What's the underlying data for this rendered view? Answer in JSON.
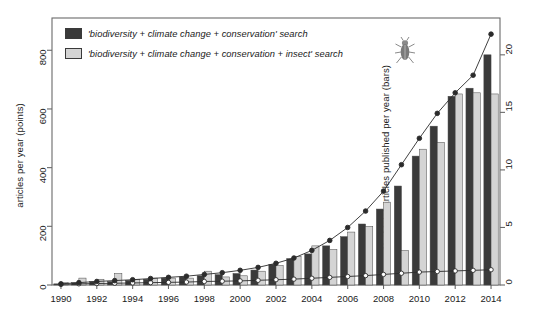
{
  "axes": {
    "left_title": "articles per year (points)",
    "right_title": "% of total articles published per year (bars)",
    "left_ticks": [
      "0",
      "200",
      "400",
      "600",
      "800"
    ],
    "right_ticks": [
      "0",
      "5",
      "10",
      "15",
      "20"
    ],
    "x_ticks": [
      "1990",
      "1992",
      "1994",
      "1996",
      "1998",
      "2000",
      "2002",
      "2004",
      "2006",
      "2008",
      "2010",
      "2012",
      "2014"
    ]
  },
  "legend": {
    "items": [
      {
        "label": "'biodiversity + climate change + conservation' search",
        "color": "#3a3a3a"
      },
      {
        "label": "'biodiversity + climate change + conservation + insect' search",
        "color": "#d4d4d4"
      }
    ],
    "decoration_icon": "beetle-icon"
  },
  "colors": {
    "dark_bar": "#3a3a3a",
    "light_bar": "#d4d4d4",
    "bar_stroke": "#4a4a4a",
    "line": "#2b2b2b",
    "frame": "#6a6a6a"
  },
  "chart_data": {
    "type": "bar",
    "title": "",
    "xlabel": "",
    "ylabel": "% of total articles published per year (bars)",
    "ylabel_secondary": "articles per year (points)",
    "grid": false,
    "legend_position": "top-left",
    "x": [
      1990,
      1991,
      1992,
      1993,
      1994,
      1995,
      1996,
      1997,
      1998,
      1999,
      2000,
      2001,
      2002,
      2003,
      2004,
      2005,
      2006,
      2007,
      2008,
      2009,
      2010,
      2011,
      2012,
      2013,
      2014
    ],
    "categories": [
      "1990",
      "1991",
      "1992",
      "1993",
      "1994",
      "1995",
      "1996",
      "1997",
      "1998",
      "1999",
      "2000",
      "2001",
      "2002",
      "2003",
      "2004",
      "2005",
      "2006",
      "2007",
      "2008",
      "2009",
      "2010",
      "2011",
      "2012",
      "2013",
      "2014"
    ],
    "ylim_bars": [
      0,
      23.2
    ],
    "ylim_points": [
      0,
      910
    ],
    "series": [
      {
        "name": "'biodiversity + climate change + conservation' search",
        "type": "bar",
        "axis": "right",
        "unit": "%",
        "color": "#3a3a3a",
        "values": [
          0.1,
          0.2,
          0.3,
          0.3,
          0.4,
          0.5,
          0.6,
          0.7,
          0.8,
          0.9,
          1.0,
          1.3,
          1.8,
          2.3,
          2.7,
          3.4,
          4.2,
          5.3,
          6.6,
          8.6,
          11.2,
          13.8,
          16.4,
          17.1,
          20.0
        ]
      },
      {
        "name": "'biodiversity + climate change + conservation + insect' search",
        "type": "bar",
        "axis": "right",
        "unit": "%",
        "color": "#d4d4d4",
        "values": [
          0.2,
          0.6,
          0.5,
          1.0,
          0.5,
          0.6,
          0.6,
          0.6,
          1.2,
          0.7,
          0.8,
          1.2,
          1.7,
          2.5,
          3.4,
          3.1,
          4.6,
          5.1,
          7.2,
          3.0,
          11.8,
          12.4,
          16.6,
          16.7,
          16.6
        ]
      },
      {
        "name": "articles per year (filled points)",
        "type": "line",
        "axis": "left",
        "unit": "articles",
        "marker": "filled-circle",
        "color": "#2b2b2b",
        "values": [
          4,
          8,
          12,
          15,
          18,
          22,
          26,
          30,
          36,
          42,
          50,
          60,
          74,
          92,
          118,
          152,
          196,
          252,
          320,
          410,
          500,
          585,
          655,
          715,
          855
        ]
      },
      {
        "name": "articles per year (open points)",
        "type": "line",
        "axis": "left",
        "unit": "articles",
        "marker": "open-circle",
        "color": "#2b2b2b",
        "values": [
          2,
          4,
          5,
          6,
          7,
          8,
          9,
          10,
          12,
          13,
          14,
          16,
          18,
          20,
          23,
          26,
          29,
          32,
          36,
          40,
          44,
          46,
          48,
          50,
          52
        ]
      }
    ]
  }
}
